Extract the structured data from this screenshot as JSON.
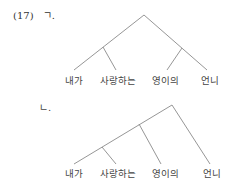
{
  "example_number": "(17)",
  "trees": [
    {
      "label": "ㄱ.",
      "words": [
        "내가",
        "사랑하는",
        "영이의",
        "언니"
      ],
      "structure": "[[내가 사랑하는] [영이의 언니]]"
    },
    {
      "label": "ㄴ.",
      "words": [
        "내가",
        "사랑하는",
        "영이의",
        "언니"
      ],
      "structure": "[[[내가 사랑하는] 영이의] 언니]"
    }
  ]
}
